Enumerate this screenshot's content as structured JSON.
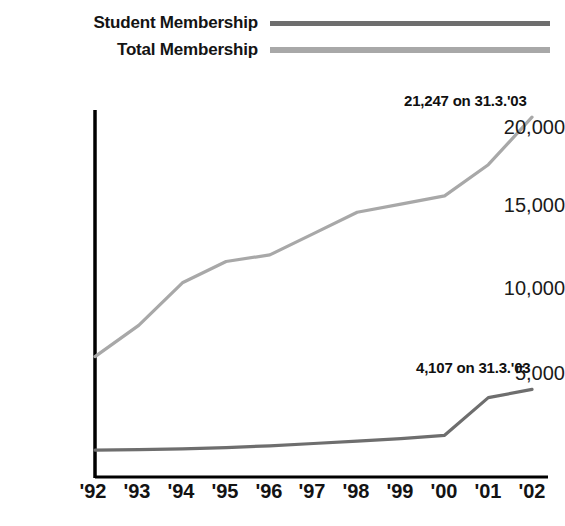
{
  "legend": {
    "entries": [
      {
        "label": "Student Membership",
        "key": "student",
        "color": "#6e6e6e"
      },
      {
        "label": "Total Membership",
        "key": "total",
        "color": "#a8a8a8"
      }
    ]
  },
  "annotations": {
    "total": "21,247 on 31.3.'03",
    "student": "4,107 on 31.3.'03"
  },
  "axis": {
    "y_ticks": [
      "20,000",
      "15,000",
      "10,000",
      "5,000"
    ],
    "x_ticks": [
      "'92",
      "'93",
      "'94",
      "'95",
      "'96",
      "'97",
      "'98",
      "'99",
      "'00",
      "'01",
      "'02"
    ]
  },
  "footnote": "",
  "chart_data": {
    "type": "line",
    "title": "",
    "xlabel": "",
    "ylabel": "",
    "categories": [
      "'92",
      "'93",
      "'94",
      "'95",
      "'96",
      "'97",
      "'98",
      "'99",
      "'00",
      "'01",
      "'02"
    ],
    "ylim": [
      0,
      21500
    ],
    "xlim": [
      "'92",
      "'02"
    ],
    "grid": false,
    "legend_position": "top",
    "series": [
      {
        "name": "Student Membership",
        "color": "#6e6e6e",
        "values": [
          300,
          330,
          380,
          450,
          560,
          700,
          850,
          1000,
          1200,
          3500,
          4000
        ],
        "end_annotation": "4,107 on 31.3.'03",
        "end_value": 4107
      },
      {
        "name": "Total Membership",
        "color": "#a8a8a8",
        "values": [
          6000,
          7900,
          10500,
          11800,
          12200,
          13500,
          14800,
          15300,
          15800,
          17700,
          20600
        ],
        "end_annotation": "21,247 on 31.3.'03",
        "end_value": 21247
      }
    ]
  }
}
